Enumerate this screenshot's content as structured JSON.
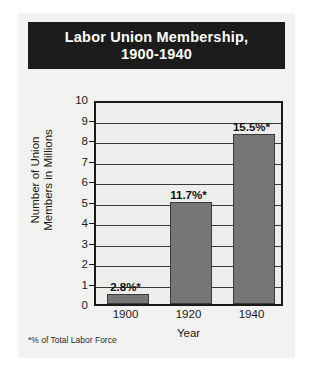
{
  "card": {
    "background_color": "#f2f2f1",
    "title_banner_color": "#1c1c1c",
    "title_text_color": "#ffffff"
  },
  "title": {
    "line1": "Labor Union Membership,",
    "line2": "1900-1940"
  },
  "footnote": "*% of Total Labor Force",
  "chart_data": {
    "type": "bar",
    "title": "Labor Union Membership, 1900-1940",
    "subtitle": "",
    "categories": [
      "1900",
      "1920",
      "1940"
    ],
    "values": [
      0.5,
      5.0,
      8.3
    ],
    "point_labels": [
      "2.8%*",
      "11.7%*",
      "15.5%*"
    ],
    "xlabel": "Year",
    "ylabel": "Number of Union Members in Millions",
    "ylabel_line1": "Number of Union",
    "ylabel_line2": "Members in Millions",
    "ylim": [
      0,
      10
    ],
    "ytick_labels": [
      "10",
      "9",
      "8",
      "7",
      "6",
      "5",
      "4",
      "3",
      "2",
      "1",
      "0"
    ],
    "ytick_values": [
      10,
      9,
      8,
      7,
      6,
      5,
      4,
      3,
      2,
      1,
      0
    ],
    "grid": true,
    "legend": false,
    "bar_color": "#767676",
    "bar_border_color": "#3b3b3b",
    "plot_background": "#ededec",
    "axis_color": "#1a1a1a",
    "annotation": "*% of Total Labor Force"
  }
}
